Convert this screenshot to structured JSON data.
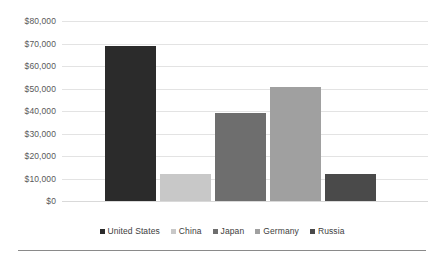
{
  "chart_data": {
    "type": "bar",
    "title": "",
    "subtitle": "",
    "xlabel": "",
    "ylabel": "",
    "categories": [
      "United States",
      "China",
      "Japan",
      "Germany",
      "Russia"
    ],
    "values": [
      69000,
      12200,
      39200,
      50800,
      12200
    ],
    "ylim": [
      0,
      80000
    ],
    "y_tick_values": [
      80000,
      70000,
      60000,
      50000,
      40000,
      30000,
      20000,
      10000,
      0
    ],
    "y_tick_labels": [
      "$80,000",
      "$70,000",
      "$60,000",
      "$50,000",
      "$40,000",
      "$30,000",
      "$20,000",
      "$10,000",
      "$0"
    ],
    "grid": true,
    "grid_axis": "y",
    "legend_position": "bottom",
    "legend": [
      {
        "label": "United States",
        "color": "#2b2b2b"
      },
      {
        "label": "China",
        "color": "#c8c8c8"
      },
      {
        "label": "Japan",
        "color": "#6e6e6e"
      },
      {
        "label": "Germany",
        "color": "#a0a0a0"
      },
      {
        "label": "Russia",
        "color": "#4a4a4a"
      }
    ],
    "series": [
      {
        "name": "Value",
        "points": [
          {
            "category": "United States",
            "value": 69000,
            "color": "#2b2b2b"
          },
          {
            "category": "China",
            "value": 12200,
            "color": "#c8c8c8"
          },
          {
            "category": "Japan",
            "value": 39200,
            "color": "#6e6e6e"
          },
          {
            "category": "Germany",
            "value": 50800,
            "color": "#a0a0a0"
          },
          {
            "category": "Russia",
            "value": 12200,
            "color": "#4a4a4a"
          }
        ]
      }
    ],
    "colors": {
      "gridline": "#e3e3e3",
      "baseline": "#d9d9d9",
      "axis_text": "#595959",
      "legend_text": "#3d3d3d",
      "rule": "#8a8a8a",
      "background": "#ffffff"
    }
  }
}
